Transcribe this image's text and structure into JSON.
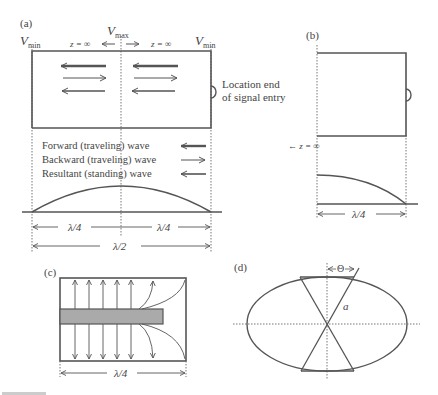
{
  "panels": {
    "a": {
      "label": "(a)",
      "vmin_left": "V",
      "vmin_left_sub": "min",
      "vmax": "V",
      "vmax_sub": "max",
      "vmin_right": "V",
      "vmin_right_sub": "min",
      "z_left": "z = ∞",
      "z_right": "z = ∞",
      "entry_label_line1": "Location end",
      "entry_label_line2": "of signal entry",
      "legend": [
        {
          "label": "Forward (traveling) wave",
          "arrow": "left-thick"
        },
        {
          "label": "Backward (traveling) wave",
          "arrow": "right-thin"
        },
        {
          "label": "Resultant (standing) wave",
          "arrow": "left-medium"
        }
      ],
      "dim_left": "λ/4",
      "dim_right": "λ/4",
      "dim_total": "λ/2"
    },
    "b": {
      "label": "(b)",
      "z_label": "← z = ∞",
      "dim": "λ/4"
    },
    "c": {
      "label": "(c)",
      "dim": "λ/4"
    },
    "d": {
      "label": "(d)",
      "theta": "Θ",
      "radius": "a"
    }
  },
  "colors": {
    "line": "#555555",
    "bar_fill": "#aaaaaa",
    "text": "#444444"
  }
}
